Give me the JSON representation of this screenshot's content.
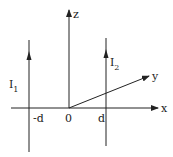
{
  "diagram": {
    "axes": {
      "x_label": "x",
      "y_label": "y",
      "z_label": "z"
    },
    "ticks": {
      "neg_d": "-d",
      "origin": "0",
      "pos_d": "d"
    },
    "wires": [
      {
        "name": "I",
        "subscript": "1",
        "position": "-d",
        "direction": "up"
      },
      {
        "name": "I",
        "subscript": "2",
        "position": "d",
        "direction": "up"
      }
    ],
    "colors": {
      "line": "#222222",
      "background": "#ffffff"
    }
  }
}
